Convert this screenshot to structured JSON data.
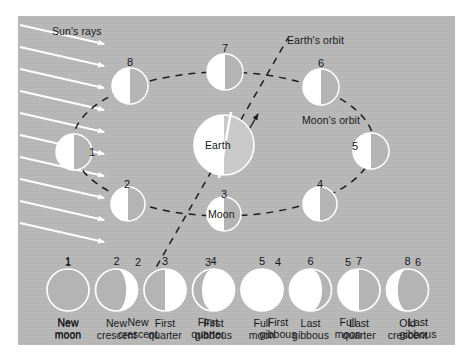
{
  "figure": {
    "background_color": "#b9b9b9",
    "panel_color": "#b9b9b9",
    "ink_color": "#16181a",
    "lit_color": "#ffffff"
  },
  "diagram": {
    "sun_rays_label": "Sun's rays",
    "earth_label": "Earth",
    "moon_label": "Moon",
    "earth_orbit_label": "Earth's orbit",
    "moon_orbit_label": "Moon's orbit",
    "moon_positions": [
      {
        "number": "1",
        "name": "new-moon",
        "x": 74,
        "y": 152,
        "r": 18,
        "phase": "half-left-lit"
      },
      {
        "number": "2",
        "name": "new-crescent",
        "x": 128,
        "y": 204,
        "r": 17,
        "phase": "half-left-lit"
      },
      {
        "number": "3",
        "name": "first-quarter",
        "x": 224,
        "y": 214,
        "r": 17,
        "phase": "half-left-lit"
      },
      {
        "number": "4",
        "name": "first-gibbous",
        "x": 320,
        "y": 204,
        "r": 17,
        "phase": "half-left-lit"
      },
      {
        "number": "5",
        "name": "full-moon",
        "x": 371,
        "y": 151,
        "r": 18,
        "phase": "half-left-lit"
      },
      {
        "number": "6",
        "name": "last-gibbous",
        "x": 321,
        "y": 87,
        "r": 18,
        "phase": "half-left-lit"
      },
      {
        "number": "7",
        "name": "last-quarter",
        "x": 225,
        "y": 72,
        "r": 18,
        "phase": "half-left-lit"
      },
      {
        "number": "8",
        "name": "old-crescent",
        "x": 130,
        "y": 86,
        "r": 18,
        "phase": "half-left-lit"
      }
    ],
    "earth": {
      "x": 224,
      "y": 145,
      "r": 30
    },
    "sun_ray_count": 10
  },
  "phase_row": {
    "items": [
      {
        "number": "1",
        "line1": "New",
        "line2": "moon",
        "phase": "new"
      },
      {
        "number": "2",
        "line1": "New",
        "line2": "crescent",
        "phase": "waxing-crescent"
      },
      {
        "number": "3",
        "line1": "First",
        "line2": "quarter",
        "phase": "first-quarter"
      },
      {
        "number": "4",
        "line1": "First",
        "line2": "gibbous",
        "phase": "waxing-gibbous"
      },
      {
        "number": "5",
        "line1": "Full",
        "line2": "moon",
        "phase": "full"
      },
      {
        "number": "6",
        "line1": "Last",
        "line2": "gibbous",
        "phase": "waning-gibbous"
      },
      {
        "number": "7",
        "line1": "Last",
        "line2": "quarter",
        "phase": "last-quarter"
      },
      {
        "number": "8",
        "line1": "Old",
        "line2": "crescent",
        "phase": "waning-crescent"
      }
    ]
  }
}
